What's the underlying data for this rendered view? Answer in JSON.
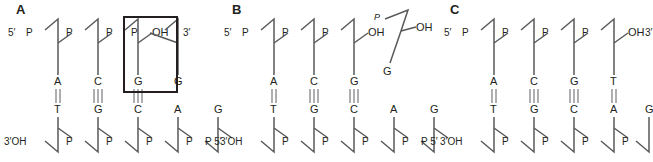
{
  "figure": {
    "type": "diagram",
    "panels": [
      {
        "id": "A",
        "letter": "A",
        "x": 0,
        "label_5prime": "5′",
        "label_3prime": "3′",
        "label_3prime_oh": "3′OH",
        "label_5prime_bottom": "P 5′",
        "top_terminus": "OH",
        "top_strand_bases": [
          "A",
          "C",
          "G",
          "G"
        ],
        "bottom_strand_bases": [
          "T",
          "G",
          "C",
          "A",
          "G"
        ],
        "top_phosphates": [
          "P",
          "P",
          "P",
          "P"
        ],
        "bottom_phosphates": [
          "P",
          "P",
          "P",
          "P",
          "P"
        ],
        "hbond_counts": [
          2,
          3,
          3
        ],
        "highlight_box": true,
        "highlight_note": "mismatched terminal G",
        "bottom_unpaired_bases": [
          "A",
          "G"
        ]
      },
      {
        "id": "B",
        "letter": "B",
        "x": 222,
        "label_5prime": "5′",
        "label_3prime_oh": "3′OH",
        "label_5prime_bottom": "P 5′",
        "top_terminus": "OH",
        "top_strand_bases": [
          "A",
          "C",
          "G"
        ],
        "bottom_strand_bases": [
          "T",
          "G",
          "C",
          "A",
          "G"
        ],
        "top_phosphates": [
          "P",
          "P",
          "P"
        ],
        "bottom_phosphates": [
          "P",
          "P",
          "P",
          "P",
          "P"
        ],
        "hbond_counts": [
          2,
          3,
          3
        ],
        "highlight_box": false,
        "excised_nucleotide": {
          "phosphate": "P",
          "hydroxyl": "OH",
          "base": "G"
        },
        "bottom_unpaired_bases": [
          "A",
          "G"
        ]
      },
      {
        "id": "C",
        "letter": "C",
        "x": 437,
        "label_5prime": "5′",
        "label_3prime": "3′",
        "label_3prime_oh": "3′OH",
        "label_5prime_bottom": "P 5′",
        "top_terminus": "OH",
        "top_strand_bases": [
          "A",
          "C",
          "G",
          "T"
        ],
        "bottom_strand_bases": [
          "T",
          "G",
          "C",
          "A",
          "G"
        ],
        "top_phosphates": [
          "P",
          "P",
          "P",
          "P"
        ],
        "bottom_phosphates": [
          "P",
          "P",
          "P",
          "P",
          "P"
        ],
        "hbond_counts": [
          2,
          3,
          3,
          2
        ],
        "highlight_box": false,
        "bottom_unpaired_bases": [
          "G"
        ]
      }
    ],
    "colors": {
      "ink": "#231f20",
      "backbone": "#58595b",
      "bond": "#6d6e71",
      "background": "#ffffff",
      "box_stroke": "#231f20"
    }
  }
}
